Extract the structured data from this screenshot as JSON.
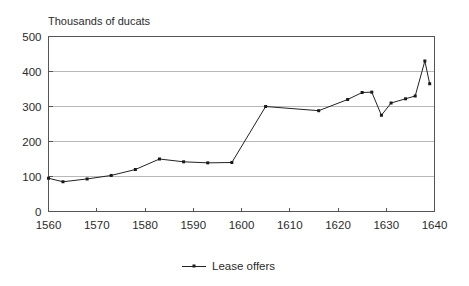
{
  "chart_data": {
    "type": "line",
    "title": "",
    "ylabel": "Thousands of ducats",
    "xlabel": "",
    "xlim": [
      1560,
      1640
    ],
    "ylim": [
      0,
      500
    ],
    "xticks": [
      1560,
      1570,
      1580,
      1590,
      1600,
      1610,
      1620,
      1630,
      1640
    ],
    "yticks": [
      0,
      100,
      200,
      300,
      400,
      500
    ],
    "xtick_labels": [
      "1560",
      "1570",
      "1580",
      "1590",
      "1600",
      "1610",
      "1620",
      "1630",
      "1640"
    ],
    "ytick_labels": [
      "0",
      "100",
      "200",
      "300",
      "400",
      "500"
    ],
    "grid": "horizontal",
    "legend_position": "bottom-center",
    "series": [
      {
        "name": "Lease offers",
        "color": "#222222",
        "marker": "square",
        "x": [
          1560,
          1563,
          1568,
          1573,
          1578,
          1583,
          1588,
          1593,
          1598,
          1605,
          1616,
          1622,
          1625,
          1627,
          1629,
          1631,
          1634,
          1636,
          1638,
          1639
        ],
        "values": [
          95,
          85,
          93,
          103,
          120,
          150,
          142,
          139,
          140,
          300,
          288,
          320,
          340,
          341,
          275,
          310,
          322,
          330,
          430,
          365
        ]
      }
    ]
  },
  "legend": {
    "entries": [
      {
        "label": "Lease offers"
      }
    ]
  },
  "axis": {
    "y_caption": "Thousands of ducats"
  }
}
